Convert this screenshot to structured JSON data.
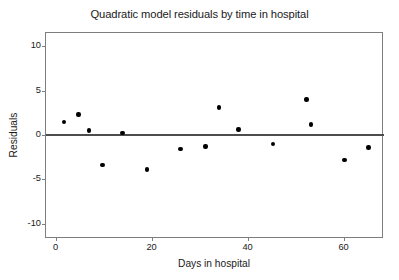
{
  "chart_data": {
    "type": "scatter",
    "title": "Quadratic model residuals by time in hospital",
    "xlabel": "Days in hospital",
    "ylabel": "Residuals",
    "xlim": [
      -2,
      68
    ],
    "ylim": [
      -11.5,
      11.5
    ],
    "xticks": [
      0,
      20,
      40,
      60
    ],
    "xtick_labels": [
      "0",
      "20",
      "40",
      "60"
    ],
    "yticks": [
      -10,
      -5,
      0,
      5,
      10
    ],
    "ytick_labels": [
      "-10",
      "-5",
      "0",
      "5",
      "10"
    ],
    "grid": false,
    "legend": null,
    "reference_lines": [
      {
        "name": "zero-line",
        "orientation": "horizontal",
        "value": 0,
        "color": "#4d4d4d"
      }
    ],
    "marker": {
      "shape": "circle",
      "color": "#000000",
      "size": 4.4
    },
    "points": [
      {
        "x": 1.7,
        "y": 1.5
      },
      {
        "x": 4.8,
        "y": 2.3
      },
      {
        "x": 7.0,
        "y": 0.5
      },
      {
        "x": 9.8,
        "y": -3.4
      },
      {
        "x": 13.9,
        "y": 0.2
      },
      {
        "x": 19.0,
        "y": -3.9
      },
      {
        "x": 26.0,
        "y": -1.6
      },
      {
        "x": 31.2,
        "y": -1.3
      },
      {
        "x": 34.0,
        "y": 3.1
      },
      {
        "x": 38.1,
        "y": 0.6
      },
      {
        "x": 45.3,
        "y": -1.0
      },
      {
        "x": 52.3,
        "y": 4.0
      },
      {
        "x": 53.2,
        "y": 1.2
      },
      {
        "x": 60.2,
        "y": -2.8
      },
      {
        "x": 65.2,
        "y": -1.4
      }
    ],
    "colors": {
      "background": "#ffffff",
      "frame": "#7e7e7e",
      "text": "#1a1a1a",
      "marker": "#000000",
      "zero_line": "#4d4d4d"
    }
  }
}
